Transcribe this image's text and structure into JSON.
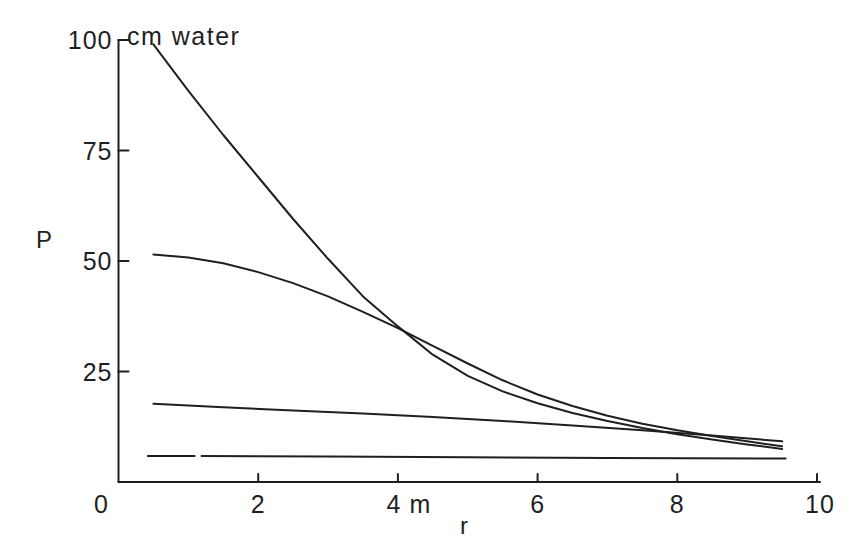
{
  "chart_data": {
    "type": "line",
    "title": "cm water",
    "xlabel": "r",
    "ylabel": "P",
    "y_unit": "cm water",
    "x_unit": "m",
    "xlim": [
      0,
      10
    ],
    "ylim": [
      0,
      100
    ],
    "grid": false,
    "legend": null,
    "x_ticks": {
      "values": [
        0,
        2,
        4,
        6,
        8,
        10
      ],
      "labels": [
        "0",
        "2",
        "4 m",
        "6",
        "8",
        "10"
      ]
    },
    "y_ticks": {
      "values": [
        25,
        50,
        75,
        100
      ],
      "labels": [
        "25",
        "50",
        "75",
        "100"
      ]
    },
    "series": [
      {
        "name": "curve-1-steep",
        "segments": [
          [
            [
              0.5,
              99
            ],
            [
              1,
              88.5
            ],
            [
              1.5,
              78.5
            ],
            [
              2,
              69
            ],
            [
              2.5,
              59.5
            ],
            [
              3,
              50.5
            ],
            [
              3.5,
              42
            ],
            [
              4,
              35.2
            ],
            [
              4.5,
              28.8
            ],
            [
              5,
              24
            ],
            [
              5.5,
              20.5
            ],
            [
              6,
              17.8
            ],
            [
              6.5,
              15.6
            ],
            [
              7,
              13.8
            ],
            [
              7.5,
              12.2
            ],
            [
              8,
              10.8
            ],
            [
              8.5,
              9.6
            ],
            [
              9,
              8.5
            ],
            [
              9.5,
              7.5
            ]
          ]
        ]
      },
      {
        "name": "curve-2",
        "segments": [
          [
            [
              0.5,
              51.5
            ],
            [
              1,
              50.8
            ],
            [
              1.5,
              49.5
            ],
            [
              2,
              47.5
            ],
            [
              2.5,
              45
            ],
            [
              3,
              42
            ],
            [
              3.5,
              38.5
            ],
            [
              4,
              34.8
            ],
            [
              4.5,
              30.8
            ],
            [
              5,
              26.8
            ],
            [
              5.5,
              23
            ],
            [
              6,
              19.8
            ],
            [
              6.5,
              17.2
            ],
            [
              7,
              15
            ],
            [
              7.5,
              13.2
            ],
            [
              8,
              11.7
            ],
            [
              8.5,
              10.4
            ],
            [
              9,
              9.2
            ],
            [
              9.5,
              8.1
            ]
          ]
        ]
      },
      {
        "name": "curve-3",
        "segments": [
          [
            [
              0.5,
              17.7
            ],
            [
              1.5,
              16.9
            ],
            [
              2.5,
              16.2
            ],
            [
              3.5,
              15.5
            ],
            [
              4.5,
              14.7
            ],
            [
              5.5,
              13.8
            ],
            [
              6.5,
              12.8
            ],
            [
              7.5,
              11.7
            ],
            [
              8.5,
              10.5
            ],
            [
              9.5,
              9.2
            ]
          ]
        ]
      },
      {
        "name": "curve-4-flat",
        "segments": [
          [
            [
              0.42,
              5.9
            ],
            [
              1.09,
              5.9
            ]
          ],
          [
            [
              1.19,
              5.9
            ],
            [
              3,
              5.75
            ],
            [
              5,
              5.6
            ],
            [
              7,
              5.45
            ],
            [
              9.55,
              5.3
            ]
          ]
        ]
      }
    ],
    "ink_color": "#1f1f1f",
    "background": "#ffffff"
  }
}
